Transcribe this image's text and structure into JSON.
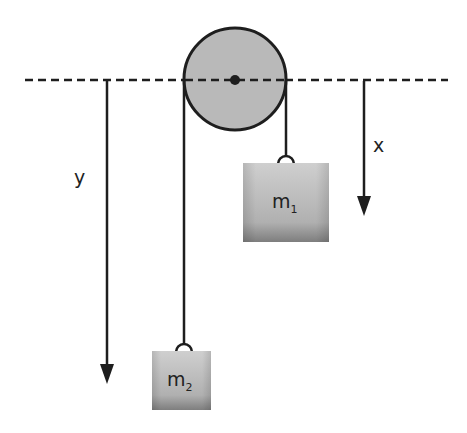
{
  "diagram": {
    "labels": {
      "x_axis": "x",
      "y_axis": "y",
      "mass1": "m",
      "mass1_sub": "1",
      "mass2": "m",
      "mass2_sub": "2"
    },
    "colors": {
      "line": "#1e1e1e",
      "pulley_fill": "#b9b9b9",
      "box_top": "#c8c8c8",
      "box_bottom": "#8a8a8a",
      "background": "#ffffff"
    }
  }
}
